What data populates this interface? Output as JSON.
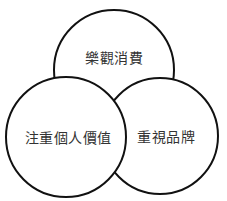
{
  "diagram": {
    "type": "venn",
    "circles": [
      {
        "label": "樂觀消費",
        "cx": 114,
        "cy": 70,
        "r": 60
      },
      {
        "label": "重視品牌",
        "cx": 160,
        "cy": 136,
        "r": 58
      },
      {
        "label": "注重個人價值",
        "cx": 66,
        "cy": 137,
        "r": 60
      }
    ],
    "stroke_color": "#111111",
    "fill_color": "#ffffff"
  }
}
